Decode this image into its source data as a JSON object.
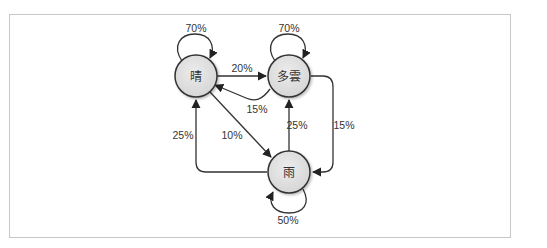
{
  "diagram": {
    "type": "state-transition",
    "nodes": [
      {
        "id": "sunny",
        "label": "晴"
      },
      {
        "id": "cloudy",
        "label": "多雲"
      },
      {
        "id": "rain",
        "label": "雨"
      }
    ],
    "edges": [
      {
        "from": "sunny",
        "to": "sunny",
        "label": "70%"
      },
      {
        "from": "cloudy",
        "to": "cloudy",
        "label": "70%"
      },
      {
        "from": "rain",
        "to": "rain",
        "label": "50%"
      },
      {
        "from": "sunny",
        "to": "cloudy",
        "label": "20%"
      },
      {
        "from": "cloudy",
        "to": "sunny",
        "label": "15%"
      },
      {
        "from": "sunny",
        "to": "rain",
        "label": "10%"
      },
      {
        "from": "rain",
        "to": "sunny",
        "label": "25%"
      },
      {
        "from": "rain",
        "to": "cloudy",
        "label": "25%"
      },
      {
        "from": "cloudy",
        "to": "rain",
        "label": "15%"
      }
    ],
    "colors": {
      "node_fill": "#e0e0e0",
      "node_stroke": "#333333",
      "edge": "#333333",
      "frame_border": "#c8c8c8"
    }
  }
}
